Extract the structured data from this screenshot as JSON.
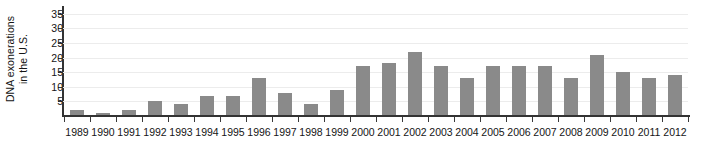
{
  "chart_data": {
    "type": "bar",
    "title": "",
    "subtitle": "",
    "xlabel": "",
    "ylabel": "DNA exonerations in the U.S.",
    "ylabel_line1": "DNA exonerations",
    "ylabel_line2": "in the U.S.",
    "categories": [
      "1989",
      "1990",
      "1991",
      "1992",
      "1993",
      "1994",
      "1995",
      "1996",
      "1997",
      "1998",
      "1999",
      "2000",
      "2001",
      "2002",
      "2003",
      "2004",
      "2005",
      "2006",
      "2007",
      "2008",
      "2009",
      "2010",
      "2011",
      "2012"
    ],
    "values": [
      2,
      1,
      2,
      5,
      4,
      7,
      7,
      13,
      8,
      4,
      9,
      17,
      18,
      22,
      17,
      13,
      17,
      17,
      17,
      13,
      21,
      15,
      13,
      14
    ],
    "ylim": [
      0,
      37
    ],
    "y_ticks": [
      5,
      10,
      15,
      20,
      25,
      30,
      35
    ],
    "y_tick_labels": [
      "5",
      "10",
      "15",
      "20",
      "25",
      "30",
      "35"
    ],
    "grid": true,
    "legend": "none",
    "bar_color": "#8a8a8a",
    "grid_color": "#ececec",
    "axis_color": "#333333",
    "background_color": "#ffffff"
  }
}
